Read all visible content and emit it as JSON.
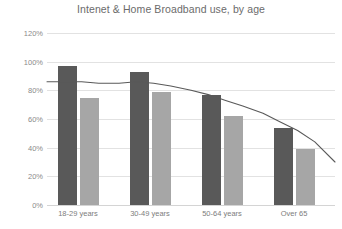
{
  "chart_data": {
    "type": "bar",
    "title": "Intenet & Home Broadband use, by age",
    "xlabel": "",
    "ylabel": "",
    "categories": [
      "18-29 years",
      "30-49 years",
      "50-64 years",
      "Over 65"
    ],
    "ylim": [
      0,
      120
    ],
    "ytick_labels": [
      "0%",
      "20%",
      "40%",
      "60%",
      "80%",
      "100%",
      "120%"
    ],
    "ytick_values": [
      0,
      20,
      40,
      60,
      80,
      100,
      120
    ],
    "grid": true,
    "legend": "none",
    "series": [
      {
        "name": "Internet use",
        "type": "bar",
        "color": "#595959",
        "values": [
          97,
          93,
          77,
          54
        ]
      },
      {
        "name": "Home broadband",
        "type": "bar",
        "color": "#a6a6a6",
        "values": [
          75,
          79,
          62,
          39
        ]
      },
      {
        "name": "Trend",
        "type": "line",
        "color": "#595959",
        "x": [
          0,
          6,
          12,
          18,
          25,
          31,
          37,
          43,
          50,
          56,
          62,
          68,
          75,
          81,
          87,
          93,
          100
        ],
        "values": [
          86,
          86,
          86,
          85,
          85,
          86,
          85,
          83,
          80,
          77,
          73,
          69,
          64,
          58,
          52,
          44,
          30
        ]
      }
    ]
  },
  "colors": {
    "series_a": "#595959",
    "series_b": "#a6a6a6",
    "line": "#595959",
    "grid": "#e2e2e2",
    "axis": "#d4d4d4",
    "title_text": "#6b6b6b",
    "tick_text": "#8a8a8a",
    "background": "#ffffff"
  }
}
